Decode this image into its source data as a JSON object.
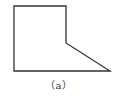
{
  "diagram": {
    "caption": "（a）",
    "stroke_color": "#333333",
    "shape": {
      "type": "polygon",
      "points": [
        [
          14,
          6
        ],
        [
          66,
          6
        ],
        [
          66,
          43
        ],
        [
          110,
          71
        ],
        [
          14,
          71
        ]
      ]
    }
  }
}
